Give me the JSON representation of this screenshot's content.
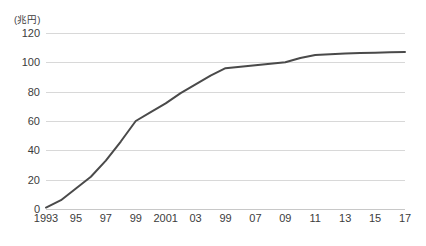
{
  "chart_data": {
    "type": "line",
    "title": "",
    "subtitle": "",
    "xlabel": "",
    "ylabel": "",
    "unit_label": "(兆円)",
    "ylim": [
      0,
      120
    ],
    "y_ticks": [
      0,
      20,
      40,
      60,
      80,
      100,
      120
    ],
    "y_tick_labels": [
      "0",
      "20",
      "40",
      "60",
      "80",
      "100",
      "120"
    ],
    "xlim": [
      1993,
      2017
    ],
    "x_tick_values": [
      1993,
      1995,
      1997,
      1999,
      2001,
      2003,
      2005,
      2007,
      2009,
      2011,
      2013,
      2015,
      2017
    ],
    "x_tick_labels": [
      "1993",
      "95",
      "97",
      "99",
      "2001",
      "03",
      "99",
      "07",
      "09",
      "11",
      "13",
      "15",
      "17"
    ],
    "grid": "horizontal",
    "legend": "none",
    "series": [
      {
        "name": "",
        "color": "#4a4a4a",
        "line_width": 2,
        "markers": false,
        "x": [
          1993,
          1994,
          1995,
          1996,
          1997,
          1998,
          1999,
          2000,
          2001,
          2002,
          2003,
          2004,
          2005,
          2006,
          2007,
          2008,
          2009,
          2010,
          2011,
          2012,
          2013,
          2014,
          2015,
          2016,
          2017
        ],
        "values": [
          1,
          6,
          14,
          22,
          33,
          46,
          60,
          66,
          72,
          79,
          85,
          91,
          96,
          97,
          98,
          99,
          100,
          103,
          105,
          105.5,
          106,
          106.3,
          106.6,
          106.9,
          107
        ]
      }
    ]
  }
}
